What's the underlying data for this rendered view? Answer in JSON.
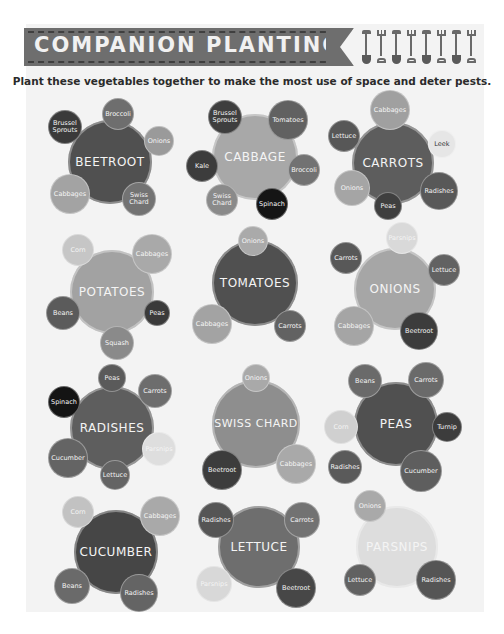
{
  "header": {
    "title": "COMPANION PLANTING",
    "subtitle": "Plant these vegetables together to make the most use of space and deter pests.",
    "tool_icons": [
      "shovel-icon",
      "fork-icon",
      "shovel-icon",
      "fork-icon",
      "shovel-icon",
      "fork-icon",
      "shovel-icon",
      "fork-icon"
    ]
  },
  "colors": {
    "banner": "#6e6e6e",
    "background": "#f3f3f3",
    "text": "#2b2b2b"
  },
  "clusters": [
    {
      "name": "BEETROOT",
      "companions": [
        "Brussel Sprouts",
        "Broccoli",
        "Onions",
        "Cabbages",
        "Swiss Chard"
      ]
    },
    {
      "name": "CABBAGE",
      "companions": [
        "Brussel Sprouts",
        "Tomatoes",
        "Kale",
        "Broccoli",
        "Swiss Chard",
        "Spinach"
      ]
    },
    {
      "name": "CARROTS",
      "companions": [
        "Cabbages",
        "Lettuce",
        "Leek",
        "Onions",
        "Peas",
        "Radishes"
      ]
    },
    {
      "name": "POTATOES",
      "companions": [
        "Corn",
        "Cabbages",
        "Beans",
        "Peas",
        "Squash"
      ]
    },
    {
      "name": "TOMATOES",
      "companions": [
        "Onions",
        "Cabbages",
        "Carrots"
      ]
    },
    {
      "name": "ONIONS",
      "companions": [
        "Parsnips",
        "Carrots",
        "Lettuce",
        "Cabbages",
        "Beetroot"
      ]
    },
    {
      "name": "RADISHES",
      "companions": [
        "Peas",
        "Carrots",
        "Spinach",
        "Parsnips",
        "Cucumber",
        "Lettuce"
      ]
    },
    {
      "name": "SWISS CHARD",
      "companions": [
        "Onions",
        "Beetroot",
        "Cabbages"
      ]
    },
    {
      "name": "PEAS",
      "companions": [
        "Beans",
        "Carrots",
        "Corn",
        "Turnip",
        "Radishes",
        "Cucumber"
      ]
    },
    {
      "name": "CUCUMBER",
      "companions": [
        "Corn",
        "Cabbages",
        "Beans",
        "Radishes"
      ]
    },
    {
      "name": "LETTUCE",
      "companions": [
        "Radishes",
        "Carrots",
        "Parsnips",
        "Beetroot"
      ]
    },
    {
      "name": "PARSNIPS",
      "companions": [
        "Onions",
        "Lettuce",
        "Radishes"
      ]
    }
  ]
}
